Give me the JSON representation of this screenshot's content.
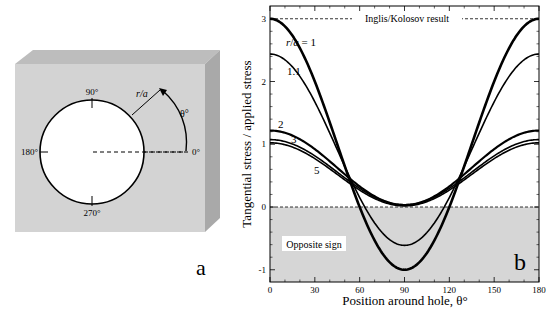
{
  "panel_a": {
    "label": "a",
    "angle_labels": {
      "top": "90°",
      "left": "180°",
      "bottom": "270°",
      "right": "0°"
    },
    "radius_label": "r/a",
    "theta_label": "θ°",
    "colors": {
      "front": "#d3d3d3",
      "top": "#bdbdbd",
      "side": "#a9a9a9",
      "hole": "#ffffff"
    }
  },
  "panel_b": {
    "label": "b",
    "reference_label": "Inglis/Kolosov result",
    "shaded_label": "Opposite sign",
    "shaded_color": "#d6d6d6"
  },
  "chart_data": {
    "type": "line",
    "title": "",
    "xlabel": "Position around hole, θ°",
    "ylabel": "Tangential stress / applied stress",
    "xlim": [
      0,
      180
    ],
    "ylim": [
      -1.2,
      3.2
    ],
    "xticks": [
      0,
      30,
      60,
      90,
      120,
      150,
      180
    ],
    "yticks": [
      -1,
      0,
      1,
      2,
      3
    ],
    "grid": false,
    "legend": "inline labels",
    "formula": "0.5*(1+(a/r)^2) + 0.5*(1+3*(a/r)^4)*cos(2θ)",
    "reference_line": {
      "y": 3,
      "label": "Inglis/Kolosov result",
      "style": "dashed"
    },
    "zero_line": {
      "y": 0,
      "style": "dashed"
    },
    "shaded_region": {
      "y_from": -1.2,
      "y_to": 0,
      "label": "Opposite sign"
    },
    "x": [
      0,
      15,
      30,
      45,
      60,
      75,
      90,
      105,
      120,
      135,
      150,
      165,
      180
    ],
    "series": [
      {
        "name": "r/a = 1",
        "label": "r/a = 1",
        "ratio": 1.0,
        "width": 2.6,
        "values": [
          3.0,
          2.73,
          2.0,
          1.0,
          0.0,
          -0.73,
          -1.0,
          -0.73,
          0.0,
          1.0,
          2.0,
          2.73,
          3.0
        ]
      },
      {
        "name": "r/a = 1.1",
        "label": "1.1",
        "ratio": 1.1,
        "width": 1.6,
        "values": [
          2.44,
          2.23,
          1.68,
          0.91,
          0.15,
          -0.41,
          -0.61,
          -0.41,
          0.15,
          0.91,
          1.68,
          2.23,
          2.44
        ]
      },
      {
        "name": "r/a = 2",
        "label": "2",
        "ratio": 2.0,
        "width": 2.2,
        "values": [
          1.22,
          1.14,
          0.92,
          0.63,
          0.33,
          0.11,
          0.03,
          0.11,
          0.33,
          0.63,
          0.92,
          1.14,
          1.22
        ]
      },
      {
        "name": "r/a = 3",
        "label": "3",
        "ratio": 3.0,
        "width": 1.6,
        "values": [
          1.07,
          1.01,
          0.81,
          0.56,
          0.3,
          0.11,
          0.04,
          0.11,
          0.3,
          0.56,
          0.81,
          1.01,
          1.07
        ]
      },
      {
        "name": "r/a = 5",
        "label": "5",
        "ratio": 5.0,
        "width": 1.6,
        "values": [
          1.02,
          0.96,
          0.77,
          0.52,
          0.27,
          0.08,
          0.02,
          0.08,
          0.27,
          0.52,
          0.77,
          0.96,
          1.02
        ]
      }
    ]
  }
}
